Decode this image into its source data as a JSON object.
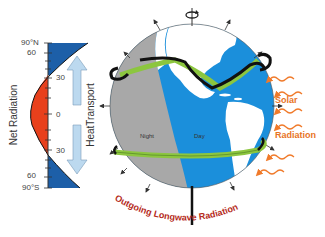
{
  "left_panel": {
    "y_axis_title": "Net Radiation",
    "transport_title": "HeatTransport",
    "ticks": [
      "90°N",
      "60",
      "30",
      "0",
      "30",
      "60",
      "90°S"
    ],
    "colors": {
      "surplus": "#e8401c",
      "deficit": "#1d5fa8",
      "arrow": "#bcd9ef"
    }
  },
  "globe": {
    "night_label": "Night",
    "day_label": "Day",
    "colors": {
      "ocean": "#1b8fdb",
      "night": "#a8a8a8",
      "land": "#ffffff",
      "current": "#8cc63f",
      "atmos": "#111111"
    }
  },
  "labels": {
    "solar_1": "Solar",
    "solar_2": "Radiation",
    "outgoing": "Outgoing Longwave Radiation"
  },
  "colors": {
    "solar": "#f07a2a",
    "outgoing_text": "#b52a1a"
  }
}
